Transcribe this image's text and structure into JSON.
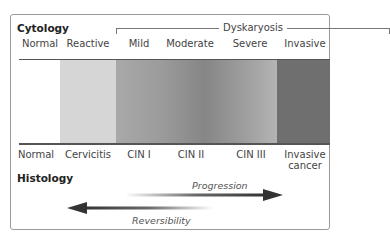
{
  "diagram": {
    "title_top": "Cytology",
    "title_bottom": "Histology",
    "dyskaryosis_label": "Dyskaryosis",
    "cytology_labels": [
      {
        "text": "Normal",
        "x": 40
      },
      {
        "text": "Reactive",
        "x": 88
      },
      {
        "text": "Mild",
        "x": 139
      },
      {
        "text": "Moderate",
        "x": 190
      },
      {
        "text": "Severe",
        "x": 250
      },
      {
        "text": "Invasive",
        "x": 305
      }
    ],
    "histology_labels": [
      {
        "text": "Normal",
        "x": 36
      },
      {
        "text": "Cervicitis",
        "x": 88
      },
      {
        "text": "CIN I",
        "x": 139
      },
      {
        "text": "CIN II",
        "x": 191
      },
      {
        "text": "CIN III",
        "x": 251
      },
      {
        "text": "Invasive",
        "x": 305,
        "line2": "cancer"
      }
    ],
    "band_segments": [
      {
        "name": "normal",
        "color": "#ffffff"
      },
      {
        "name": "reactive",
        "color": "#d6d6d6"
      },
      {
        "name": "dyskaryosis",
        "color_start": "#a9a9a9",
        "color_mid": "#868686",
        "color_end": "#b4b4b4"
      },
      {
        "name": "invasive",
        "color": "#6f6f6f"
      }
    ],
    "arrows": {
      "progression": {
        "label": "Progression",
        "direction": "right"
      },
      "reversibility": {
        "label": "Reversibility",
        "direction": "left"
      }
    }
  }
}
